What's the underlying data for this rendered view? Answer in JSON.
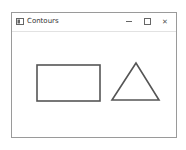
{
  "window": {
    "title": "Contours",
    "controls": {
      "minimize": "—",
      "maximize": "☐",
      "close": "✕"
    }
  },
  "shapes": [
    {
      "type": "rectangle",
      "name": "rectangle-contour"
    },
    {
      "type": "triangle",
      "name": "triangle-contour"
    }
  ],
  "colors": {
    "stroke": "#555555",
    "background": "#ffffff"
  }
}
